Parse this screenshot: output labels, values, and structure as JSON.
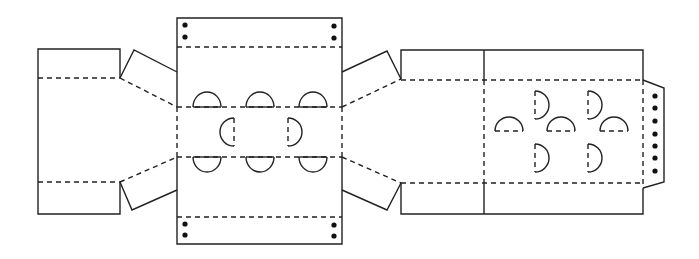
{
  "diagram": {
    "title": "",
    "colors": {
      "line": "#222222",
      "dot": "#111111",
      "background": "#ffffff"
    },
    "legend": {
      "solid_line": "cut line",
      "dashed_line": "fold line",
      "dot": "hole marker"
    },
    "panels": [
      {
        "id": "left-side-panel",
        "label": ""
      },
      {
        "id": "left-top-tab",
        "label": ""
      },
      {
        "id": "left-bottom-tab",
        "label": ""
      },
      {
        "id": "center-panel",
        "label": ""
      },
      {
        "id": "center-top-flap",
        "label": "",
        "dots": 4
      },
      {
        "id": "center-bottom-flap",
        "label": "",
        "dots": 4
      },
      {
        "id": "right-top-tab",
        "label": ""
      },
      {
        "id": "right-bottom-tab",
        "label": ""
      },
      {
        "id": "right-panel-small",
        "label": ""
      },
      {
        "id": "right-panel-large",
        "label": ""
      },
      {
        "id": "right-end-tab",
        "label": "",
        "dots": 7
      }
    ],
    "cutout_counts": {
      "center_top_row": 3,
      "center_middle_row": 2,
      "center_bottom_row": 3,
      "right_panel_domes": 3,
      "right_panel_d_shapes": 4
    }
  }
}
